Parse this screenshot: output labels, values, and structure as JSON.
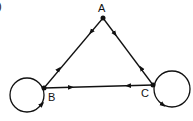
{
  "diagram": {
    "corner_mark": ")",
    "nodes": [
      {
        "id": "A",
        "label": "A",
        "x": 103,
        "y": 18
      },
      {
        "id": "B",
        "label": "B",
        "x": 44,
        "y": 88
      },
      {
        "id": "C",
        "label": "C",
        "x": 153,
        "y": 85
      }
    ],
    "edges": [
      {
        "from": "A",
        "to": "B",
        "bidirectional": true
      },
      {
        "from": "A",
        "to": "C",
        "bidirectional": true
      },
      {
        "from": "B",
        "to": "C",
        "bidirectional": true
      },
      {
        "from": "B",
        "to": "B",
        "type": "self-loop"
      },
      {
        "from": "C",
        "to": "C",
        "type": "self-loop"
      }
    ],
    "colors": {
      "stroke": "#111111",
      "background": "#ffffff"
    }
  }
}
